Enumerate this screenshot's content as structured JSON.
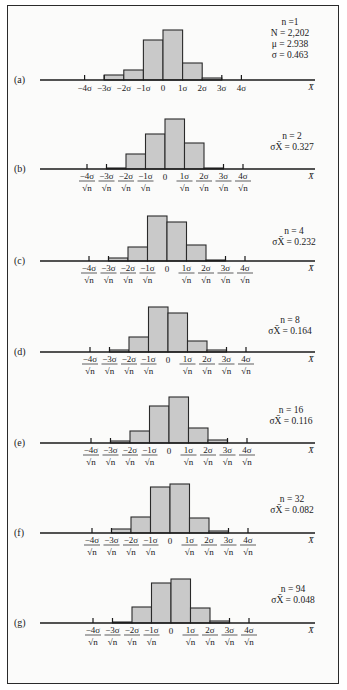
{
  "chart_data": {
    "type": "bar",
    "xlabel": "X̄",
    "bin_edges_sigma_units": [
      -3,
      -2,
      -1,
      0,
      1,
      2,
      3
    ],
    "categories": [
      "-3σ to -2σ",
      "-2σ to -1σ",
      "-1σ to 0",
      "0 to 1σ",
      "1σ to 2σ",
      "2σ to 3σ"
    ],
    "tick_labels_a": [
      "−4σ",
      "−3σ",
      "−2σ",
      "−1σ",
      "0",
      "1σ",
      "2σ",
      "3σ",
      "4σ"
    ],
    "tick_labels_b_to_g": [
      "−4σ/√n",
      "−3σ/√n",
      "−2σ/√n",
      "−1σ/√n",
      "0",
      "1σ/√n",
      "2σ/√n",
      "3σ/√n",
      "4σ/√n"
    ],
    "series": [
      {
        "name": "(a)",
        "n": 1,
        "stats": [
          "n =1",
          "N = 2,202",
          "μ = 2.938",
          "σ = 0.463"
        ],
        "values": [
          5,
          10,
          40,
          50,
          17,
          2
        ]
      },
      {
        "name": "(b)",
        "n": 2,
        "stats": [
          "n = 2",
          "σX̄ = 0.327"
        ],
        "values": [
          1,
          15,
          35,
          50,
          26,
          1
        ]
      },
      {
        "name": "(c)",
        "n": 4,
        "stats": [
          "n = 4",
          "σX̄ = 0.232"
        ],
        "values": [
          3,
          14,
          45,
          39,
          16,
          1
        ]
      },
      {
        "name": "(d)",
        "n": 8,
        "stats": [
          "n = 8",
          "σX̄ = 0.164"
        ],
        "values": [
          2,
          15,
          45,
          39,
          11,
          2
        ]
      },
      {
        "name": "(e)",
        "n": 16,
        "stats": [
          "n = 16",
          "σX̄ = 0.116"
        ],
        "values": [
          2,
          12,
          37,
          46,
          15,
          3
        ]
      },
      {
        "name": "(f)",
        "n": 32,
        "stats": [
          "n = 32",
          "σX̄ = 0.082"
        ],
        "values": [
          4,
          16,
          46,
          49,
          15,
          2
        ]
      },
      {
        "name": "(g)",
        "n": 94,
        "stats": [
          "n = 94",
          "σX̄ = 0.048"
        ],
        "values": [
          1,
          16,
          40,
          44,
          15,
          2
        ]
      }
    ],
    "grid": false,
    "legend": "none"
  },
  "panels": [
    {
      "label": "(a)",
      "baseline": 80,
      "x0": 163,
      "step": 19.6,
      "stat_x": 290,
      "stat_y": 25
    },
    {
      "label": "(b)",
      "baseline": 169,
      "x0": 165,
      "step": 19.5,
      "stat_x": 292,
      "stat_y": 139
    },
    {
      "label": "(c)",
      "baseline": 261,
      "x0": 167,
      "step": 19.5,
      "stat_x": 294,
      "stat_y": 234
    },
    {
      "label": "(d)",
      "baseline": 352,
      "x0": 168,
      "step": 19.5,
      "stat_x": 290,
      "stat_y": 323
    },
    {
      "label": "(e)",
      "baseline": 443,
      "x0": 169,
      "step": 19.5,
      "stat_x": 291,
      "stat_y": 413
    },
    {
      "label": "(f)",
      "baseline": 533,
      "x0": 170,
      "step": 19.5,
      "stat_x": 292,
      "stat_y": 502
    },
    {
      "label": "(g)",
      "baseline": 623,
      "x0": 171,
      "step": 19.5,
      "stat_x": 293,
      "stat_y": 592
    }
  ],
  "scale_px_per_unit": 1.0
}
